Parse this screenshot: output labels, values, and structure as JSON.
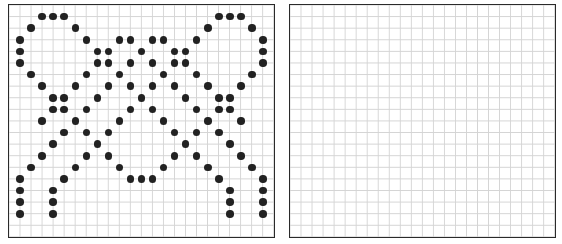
{
  "puzzle": {
    "grid": {
      "cols": 24,
      "rows": 20
    },
    "colors": {
      "border": "#2a2a2a",
      "gridline": "#d4d4d4",
      "dot": "#222222",
      "background": "#ffffff"
    },
    "source_panel": {
      "label": "source pattern",
      "dots_by_row": {
        "1": [
          3,
          4,
          5,
          19,
          20,
          21
        ],
        "2": [
          2,
          6,
          18,
          22
        ],
        "3": [
          1,
          7,
          10,
          11,
          13,
          14,
          17,
          23
        ],
        "4": [
          1,
          8,
          9,
          12,
          15,
          16,
          23
        ],
        "5": [
          1,
          8,
          9,
          11,
          13,
          15,
          16,
          23
        ],
        "6": [
          2,
          7,
          10,
          14,
          17,
          22
        ],
        "7": [
          3,
          6,
          9,
          11,
          13,
          15,
          18,
          21
        ],
        "8": [
          4,
          5,
          8,
          12,
          16,
          19,
          20
        ],
        "9": [
          4,
          5,
          7,
          11,
          13,
          17,
          19,
          20
        ],
        "10": [
          3,
          6,
          10,
          14,
          18,
          21
        ],
        "11": [
          5,
          7,
          9,
          15,
          17,
          19
        ],
        "12": [
          4,
          8,
          16,
          20
        ],
        "13": [
          3,
          7,
          9,
          15,
          17,
          21
        ],
        "14": [
          2,
          6,
          10,
          14,
          18,
          22
        ],
        "15": [
          1,
          5,
          11,
          12,
          13,
          19,
          23
        ],
        "16": [
          1,
          4,
          20,
          23
        ],
        "17": [
          1,
          4,
          20,
          23
        ],
        "18": [
          1,
          4,
          20,
          23
        ]
      }
    },
    "target_panel": {
      "label": "empty drawing grid",
      "dots_by_row": {}
    }
  }
}
